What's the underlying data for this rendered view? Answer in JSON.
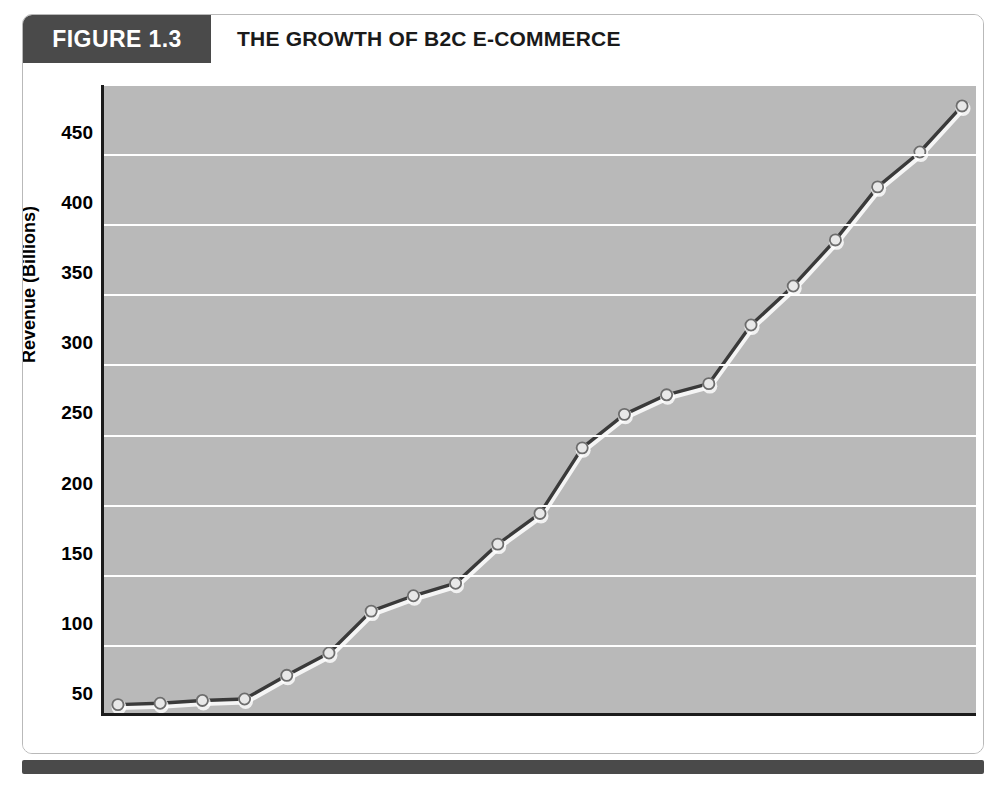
{
  "figure": {
    "number_label": "FIGURE 1.3",
    "title": "THE GROWTH OF B2C E-COMMERCE",
    "accent_color": "#4a4a4a",
    "plot_background": "#b9b9b9",
    "gridline_color": "#ffffff",
    "line_color": "#3a3a3a",
    "marker_fill": "#e8e8e8"
  },
  "chart_data": {
    "type": "line",
    "title": "THE GROWTH OF B2C E-COMMERCE",
    "xlabel": "Year",
    "ylabel": "Revenue (Billions)",
    "xlim": [
      1995,
      2015
    ],
    "ylim": [
      0,
      450
    ],
    "ytick_values": [
      0,
      50,
      100,
      150,
      200,
      250,
      300,
      350,
      400,
      450
    ],
    "ytick_labels": [
      "0",
      "50",
      "100",
      "150",
      "200",
      "250",
      "300",
      "350",
      "400",
      "450"
    ],
    "grid": true,
    "legend": "none",
    "categories": [
      "1995",
      "1996",
      "1997",
      "1998",
      "1999",
      "1700",
      "2001",
      "2002",
      "2003",
      "2004",
      "2005",
      "2006",
      "2007",
      "2008",
      "2009",
      "2010",
      "2011",
      "2012",
      "2013",
      "2014",
      "2015"
    ],
    "x": [
      1995,
      1996,
      1997,
      1998,
      1999,
      2000,
      2001,
      2002,
      2003,
      2004,
      2005,
      2006,
      2007,
      2008,
      2009,
      2010,
      2011,
      2012,
      2013,
      2014,
      2015
    ],
    "xtick_labels": [
      "1995",
      "1996",
      "1997",
      "1998",
      "1999",
      "2000",
      "2001",
      "2002",
      "2003",
      "2004",
      "2005",
      "2006",
      "2007",
      "2008",
      "2009",
      "2010",
      "2011",
      "2012",
      "2013",
      "2014",
      "2015"
    ],
    "series": [
      {
        "name": "B2C E-commerce Revenue",
        "values": [
          6,
          7,
          9,
          10,
          27,
          43,
          73,
          84,
          93,
          121,
          143,
          190,
          214,
          228,
          236,
          278,
          306,
          339,
          377,
          402,
          435
        ]
      }
    ]
  }
}
